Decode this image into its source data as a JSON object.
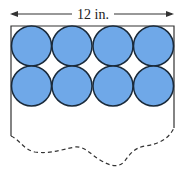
{
  "diagram": {
    "dimension_label": "12 in.",
    "rows": 2,
    "cols": 4,
    "circle_fill": "#6fa8e8",
    "circle_stroke": "#1a2a3a",
    "outline_color": "#333333"
  }
}
